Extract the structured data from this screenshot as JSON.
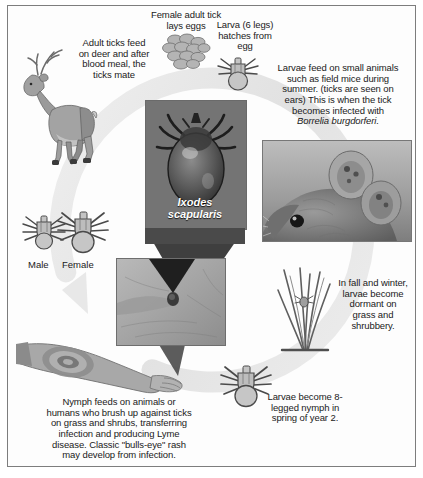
{
  "figure": {
    "border_color": "#7d7d7d",
    "background": "#ffffff",
    "ring_color": "#e3e3e3"
  },
  "labels": {
    "adult_feed": "Adult ticks feed\non deer and after\nblood meal, the\nticks mate",
    "female_lays_eggs": "Female adult tick\nlays eggs",
    "larva_hatches": "Larva (6 legs)\nhatches from\negg",
    "larvae_feed_line1": "Larvae feed on small animals",
    "larvae_feed_line2": "such as field mice during",
    "larvae_feed_line3": "summer. (ticks are seen on",
    "larvae_feed_line4": "ears) This is when the tick",
    "larvae_feed_line5": "becomes infected with",
    "larvae_feed_species": "Borrelia burgdorferi.",
    "fall_winter": "In fall and winter,\nlarvae become\ndormant on\ngrass and\nshrubbery.",
    "larvae_nymph": "Larvae become 8-\nlegged nymph in\nspring of year 2.",
    "nymph_feeds_line1": "Nymph feeds on animals or",
    "nymph_feeds_line2": "humans who brush up against ticks",
    "nymph_feeds_line3": "on grass and shrubs, transferring",
    "nymph_feeds_line4": "infection and producing Lyme",
    "nymph_feeds_line5": "disease. Classic \"bulls-eye\" rash",
    "nymph_feeds_line6": "may develop from infection.",
    "male": "Male",
    "female": "Female",
    "species_caption_line1": "Ixodes",
    "species_caption_line2": "scapularis"
  },
  "images": {
    "deer": "deer-illustration",
    "egg_cluster": "tick-egg-cluster-illustration",
    "larva_tick": "larva-tick-illustration",
    "adult_tick_photo": "adult-tick-photograph",
    "mouse_photo": "field-mouse-with-ticks-photograph",
    "grass_with_tick": "grass-blades-with-tick-illustration",
    "nymph_tick": "nymph-tick-illustration",
    "male_tick": "male-adult-tick-illustration",
    "female_tick": "female-adult-tick-illustration",
    "skin_tick_photo": "tick-embedded-in-skin-photograph",
    "arm_rash": "arm-with-bulls-eye-rash-illustration"
  }
}
